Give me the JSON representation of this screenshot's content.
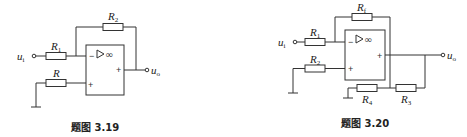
{
  "figures": [
    {
      "caption": "题图 3.19",
      "input_label": "u",
      "input_sub": "i",
      "output_label": "u",
      "output_sub": "o",
      "resistors": {
        "r1": {
          "label": "R",
          "sub": "1"
        },
        "r2": {
          "label": "R",
          "sub": "2"
        },
        "r": {
          "label": "R",
          "sub": ""
        }
      },
      "opamp": {
        "inverting_sign": "−",
        "noninverting_sign": "+",
        "output_sign": "+",
        "gain_symbol": "∞"
      }
    },
    {
      "caption": "题图 3.20",
      "input_label": "u",
      "input_sub": "i",
      "output_label": "u",
      "output_sub": "o",
      "resistors": {
        "r1": {
          "label": "R",
          "sub": "1"
        },
        "rf": {
          "label": "R",
          "sub": "f"
        },
        "r2": {
          "label": "R",
          "sub": "2"
        },
        "r3": {
          "label": "R",
          "sub": "3"
        },
        "r4": {
          "label": "R",
          "sub": "4"
        }
      },
      "opamp": {
        "inverting_sign": "−",
        "noninverting_sign": "+",
        "output_sign": "+",
        "gain_symbol": "∞"
      }
    }
  ]
}
